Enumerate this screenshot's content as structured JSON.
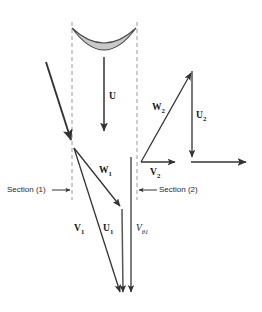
{
  "figure": {
    "background_color": "#ffffff",
    "stroke_color": "#333333",
    "bucket_fill_color": "#c9c9c9",
    "dashed_line_color": "#9a9a9a",
    "width": 262,
    "height": 312
  },
  "section_markers": [
    {
      "label": "Section (1)",
      "arrow_direction": "right",
      "x_line": 72
    },
    {
      "label": "Section (2)",
      "arrow_direction": "left",
      "x_line": 137
    }
  ],
  "vectors": [
    {
      "name": "U",
      "label": "U",
      "sub": "",
      "style": "bold",
      "description": "bucket speed, downward from bucket"
    },
    {
      "name": "W1",
      "label": "W",
      "sub": "1",
      "style": "bold",
      "description": "relative velocity at section 1"
    },
    {
      "name": "V1",
      "label": "V",
      "sub": "1",
      "style": "bold",
      "description": "absolute velocity at section 1"
    },
    {
      "name": "U1",
      "label": "U",
      "sub": "1",
      "style": "bold",
      "description": "blade velocity at section 1"
    },
    {
      "name": "Vt1",
      "label": "V",
      "sub": "θ1",
      "style": "italic",
      "description": "tangential component of V1"
    },
    {
      "name": "W2",
      "label": "W",
      "sub": "2",
      "style": "bold",
      "description": "relative velocity at section 2"
    },
    {
      "name": "U2",
      "label": "U",
      "sub": "2",
      "style": "bold",
      "description": "blade velocity at section 2"
    },
    {
      "name": "V2",
      "label": "V",
      "sub": "2",
      "style": "bold",
      "description": "absolute velocity at section 2"
    }
  ]
}
